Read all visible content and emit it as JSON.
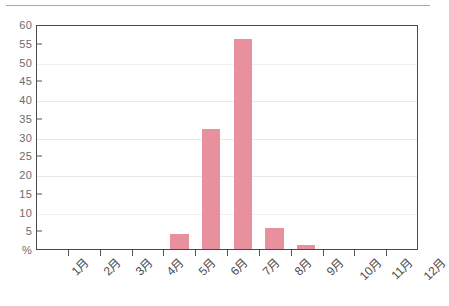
{
  "chart_data": {
    "type": "bar",
    "title": "",
    "subtitle": "",
    "xlabel": "",
    "ylabel": "%",
    "unit_label": "%",
    "categories": [
      "1月",
      "2月",
      "3月",
      "4月",
      "5月",
      "6月",
      "7月",
      "8月",
      "9月",
      "10月",
      "11月",
      "12月"
    ],
    "values": [
      0,
      0,
      0,
      0,
      4,
      32,
      56,
      5.5,
      1,
      0,
      0,
      0
    ],
    "ylim": [
      0,
      60
    ],
    "ytick_labels": [
      "60",
      "55",
      "50",
      "45",
      "40",
      "35",
      "30",
      "25",
      "20",
      "15",
      "10",
      "5",
      "%"
    ],
    "ytick_values": [
      60,
      55,
      50,
      45,
      40,
      35,
      30,
      25,
      20,
      15,
      10,
      5,
      0
    ],
    "gridline_values": [
      50,
      40,
      30,
      20,
      10
    ],
    "grid": true,
    "legend": false,
    "legend_position": "none",
    "series": [
      {
        "name": "",
        "color": "#e8909e",
        "values": [
          0,
          0,
          0,
          0,
          4,
          32,
          56,
          5.5,
          1,
          0,
          0,
          0
        ]
      }
    ],
    "colors": {
      "bar": "#e8909e",
      "axis": "#4a4a4a",
      "grid": "#e9e9e9",
      "tick_text": "#6b6b6b",
      "category_text": "#4d4d4d",
      "top_rule": "#a9a9a9"
    }
  }
}
